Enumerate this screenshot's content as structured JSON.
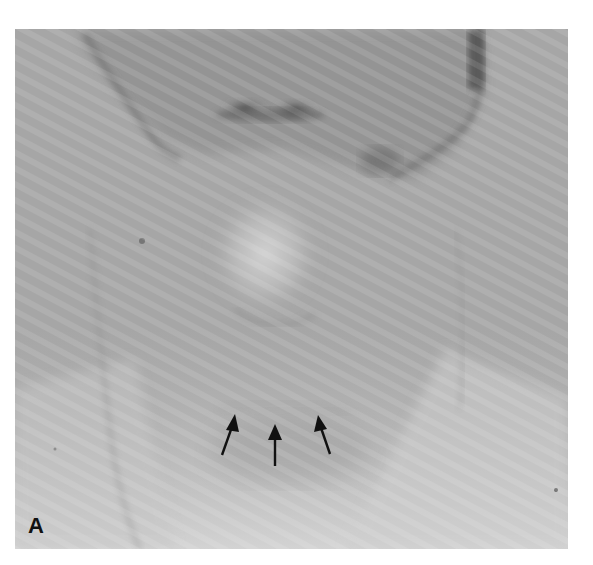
{
  "figure": {
    "panel_label": "A",
    "annotations": {
      "arrows": [
        {
          "id": "arrow-left",
          "tail": [
            222,
            455
          ],
          "tip": [
            235,
            414
          ]
        },
        {
          "id": "arrow-middle",
          "tail": [
            275,
            466
          ],
          "tip": [
            275,
            424
          ]
        },
        {
          "id": "arrow-right",
          "tail": [
            330,
            454
          ],
          "tip": [
            318,
            415
          ]
        }
      ],
      "arrow_color": "#111111"
    },
    "colors": {
      "background": "#ffffff",
      "photo_base": "#a8a8a8",
      "face_shadow": "#8a8a8a",
      "lip_dark": "#4a4a4a",
      "highlight": "#d0d0d0",
      "lower_light": "#cfcfcf"
    }
  }
}
